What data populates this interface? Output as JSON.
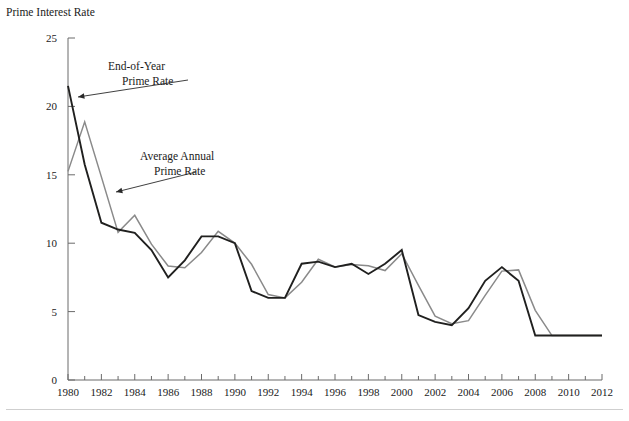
{
  "chart_data": {
    "type": "line",
    "title": "",
    "ylabel": "Prime Interest Rate",
    "xlabel": "",
    "ylim": [
      0,
      25
    ],
    "yticks": [
      0,
      5,
      10,
      15,
      20,
      25
    ],
    "xlim": [
      1980,
      2012
    ],
    "xticks": [
      1980,
      1982,
      1984,
      1986,
      1988,
      1990,
      1992,
      1994,
      1996,
      1998,
      2000,
      2002,
      2004,
      2006,
      2008,
      2010,
      2012
    ],
    "minor_xticks_every": 1,
    "grid": false,
    "legend": "annotations",
    "x": [
      1980,
      1981,
      1982,
      1983,
      1984,
      1985,
      1986,
      1987,
      1988,
      1989,
      1990,
      1991,
      1992,
      1993,
      1994,
      1995,
      1996,
      1997,
      1998,
      1999,
      2000,
      2001,
      2002,
      2003,
      2004,
      2005,
      2006,
      2007,
      2008,
      2009,
      2010,
      2011,
      2012
    ],
    "series": [
      {
        "name": "End-of-Year Prime Rate",
        "color": "#20201f",
        "values": [
          21.5,
          15.75,
          11.5,
          11.0,
          10.75,
          9.5,
          7.5,
          8.75,
          10.5,
          10.5,
          10.0,
          6.5,
          6.0,
          6.0,
          8.5,
          8.65,
          8.25,
          8.5,
          7.75,
          8.5,
          9.5,
          4.75,
          4.25,
          4.0,
          5.25,
          7.25,
          8.25,
          7.25,
          3.25,
          3.25,
          3.25,
          3.25,
          3.25
        ]
      },
      {
        "name": "Average Annual Prime Rate",
        "color": "#8a8a8a",
        "values": [
          15.25,
          18.87,
          14.85,
          10.79,
          12.04,
          9.93,
          8.33,
          8.2,
          9.32,
          10.87,
          10.01,
          8.46,
          6.25,
          6.0,
          7.15,
          8.83,
          8.27,
          8.44,
          8.35,
          8.0,
          9.23,
          6.91,
          4.67,
          4.12,
          4.34,
          6.19,
          7.96,
          8.05,
          5.09,
          3.25,
          3.25,
          3.25,
          3.25
        ]
      }
    ],
    "annotations": [
      {
        "id": "end-of-year-annotation",
        "line1": "End-of-Year",
        "line2": "Prime Rate",
        "text_x": 108,
        "text_y": 70,
        "arrow_from_x": 188,
        "arrow_from_y": 80,
        "arrow_to_x": 78,
        "arrow_to_y": 97
      },
      {
        "id": "average-annual-annotation",
        "line1": "Average Annual",
        "line2": "Prime Rate",
        "text_x": 140,
        "text_y": 160,
        "arrow_from_x": 196,
        "arrow_from_y": 172,
        "arrow_to_x": 116,
        "arrow_to_y": 192
      }
    ]
  },
  "axis": {
    "y_title": "Prime Interest Rate",
    "y_tick_labels": [
      "25",
      "20",
      "15",
      "10",
      "5",
      "0"
    ],
    "x_tick_labels": [
      "1980",
      "1982",
      "1984",
      "1986",
      "1988",
      "1990",
      "1992",
      "1994",
      "1996",
      "1998",
      "2000",
      "2002",
      "2004",
      "2006",
      "2008",
      "2010",
      "2012"
    ]
  },
  "colors": {
    "end_of_year": "#20201f",
    "average_annual": "#8a8a8a",
    "axis": "#6b6b6b",
    "text": "#1a1a1a",
    "background": "#ffffff"
  }
}
